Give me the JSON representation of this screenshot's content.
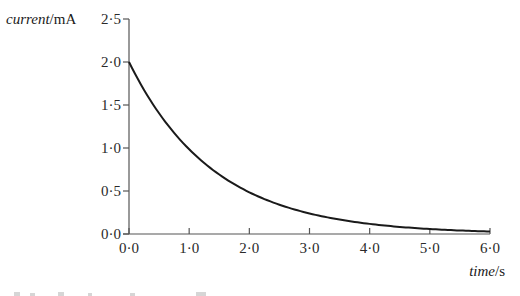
{
  "chart_data": {
    "type": "line",
    "title": "",
    "xlabel": "time/s",
    "xlabel_parts": {
      "italic": "time",
      "unit": "/s"
    },
    "ylabel": "current/mA",
    "ylabel_parts": {
      "italic": "current",
      "unit": "/mA"
    },
    "xlim": [
      0,
      6
    ],
    "ylim": [
      0,
      2.5
    ],
    "x_ticks": [
      "0·0",
      "1·0",
      "2·0",
      "3·0",
      "4·0",
      "5·0",
      "6·0"
    ],
    "y_ticks": [
      "0·0",
      "0·5",
      "1·0",
      "1·5",
      "2·0",
      "2·5"
    ],
    "grid": false,
    "legend": null,
    "series": [
      {
        "name": "current",
        "color": "#1a1a1a",
        "x": [
          0.0,
          0.5,
          1.0,
          1.5,
          2.0,
          2.5,
          3.0,
          3.5,
          4.0,
          4.5,
          5.0,
          5.5,
          6.0
        ],
        "y": [
          2.0,
          1.4,
          0.98,
          0.69,
          0.48,
          0.34,
          0.23,
          0.16,
          0.12,
          0.08,
          0.06,
          0.04,
          0.03
        ]
      }
    ]
  },
  "colors": {
    "axis": "#555555",
    "curve": "#1a1a1a",
    "text": "#2a2a2a"
  }
}
